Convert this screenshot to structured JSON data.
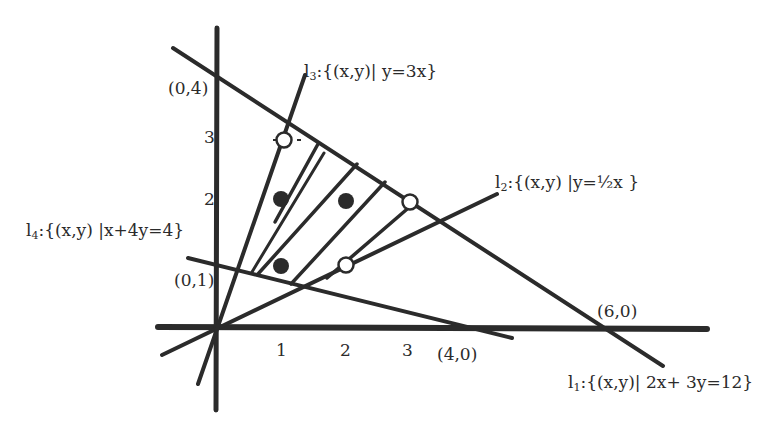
{
  "figure": {
    "type": "linear-programming-feasible-region",
    "colors": {
      "ink": "#2b2b2b",
      "background": "#ffffff"
    }
  },
  "axes": {
    "origin_px": [
      217,
      327
    ],
    "unit_px": [
      63.5,
      62.3
    ],
    "x_ticks": [
      {
        "value": 1,
        "label": "1"
      },
      {
        "value": 2,
        "label": "2"
      },
      {
        "value": 3,
        "label": "3"
      }
    ],
    "y_ticks": [
      {
        "value": 2,
        "label": "2"
      },
      {
        "value": 3,
        "label": "3"
      }
    ]
  },
  "lines": [
    {
      "id": "l1",
      "name": "l",
      "sub": "1",
      "set": ":{(x,y)| 2x+ 3y=12}",
      "equation": "2x+3y=12"
    },
    {
      "id": "l2",
      "name": "l",
      "sub": "2",
      "set": ":{(x,y) |y=½x }",
      "equation": "y=x/2"
    },
    {
      "id": "l3",
      "name": "l",
      "sub": "3",
      "set": ":{(x,y)| y=3x}",
      "equation": "y=3x"
    },
    {
      "id": "l4",
      "name": "l",
      "sub": "4",
      "set": ":{(x,y) |x+4y=4}",
      "equation": "x+4y=4"
    }
  ],
  "intercept_labels": {
    "p04": "(0,4)",
    "p01": "(0,1)",
    "p40": "(4,0)",
    "p60": "(6,0)"
  },
  "points": {
    "filled": [
      [
        1,
        2
      ],
      [
        2,
        2
      ],
      [
        1,
        1
      ]
    ],
    "open": [
      [
        1,
        3
      ],
      [
        3,
        2
      ],
      [
        2,
        1
      ]
    ]
  }
}
